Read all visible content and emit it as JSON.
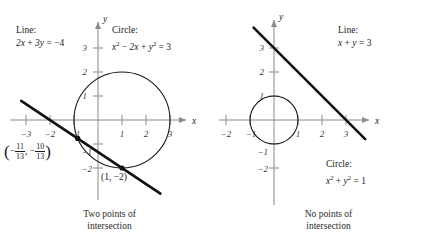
{
  "figure": {
    "background_color": "#ffffff",
    "axis_color": "#8a8a8a",
    "curve_color": "#1a1a1a",
    "line_color": "#111111",
    "text_color": "#1a1a1a"
  },
  "panels": [
    {
      "id": "left",
      "caption_line1": "Two points of",
      "caption_line2": "intersection",
      "line_label_title": "Line:",
      "line_label_equation": "2x + 3y = −4",
      "circle_label_title": "Circle:",
      "circle_label_equation": "x² − 2x + y² = 3",
      "axis_x_name": "x",
      "axis_y_name": "y",
      "x_ticks": [
        "−3",
        "−2",
        "−1",
        "1",
        "2",
        "3"
      ],
      "y_ticks": [
        "3",
        "2",
        "1",
        "−1",
        "−2"
      ],
      "point_label_fraction_x_num": "11",
      "point_label_fraction_x_den": "13",
      "point_label_fraction_y_num": "10",
      "point_label_fraction_y_den": "13",
      "point_label_simple": "(1, −2)"
    },
    {
      "id": "right",
      "caption_line1": "No points of",
      "caption_line2": "intersection",
      "line_label_title": "Line:",
      "line_label_equation": "x + y = 3",
      "circle_label_title": "Circle:",
      "circle_label_equation": "x² + y² = 1",
      "axis_x_name": "x",
      "axis_y_name": "y",
      "x_ticks": [
        "−2",
        "−1",
        "1",
        "2",
        "3"
      ],
      "y_ticks": [
        "3",
        "2",
        "1",
        "−1",
        "−2"
      ]
    }
  ],
  "chart_data": [
    {
      "type": "scatter",
      "title": "Two points of intersection",
      "xlabel": "x",
      "ylabel": "y",
      "xlim": [
        -3.6,
        3.6
      ],
      "ylim": [
        -2.9,
        3.4
      ],
      "grid": false,
      "legend": "none",
      "xticks": [
        -3,
        -2,
        -1,
        1,
        2,
        3
      ],
      "yticks": [
        3,
        2,
        1,
        -1,
        -2
      ],
      "series": [
        {
          "name": "Line: 2x + 3y = -4",
          "kind": "line",
          "equation": "2x + 3y = -4",
          "slope": -0.6666666667,
          "intercept": -1.3333333333,
          "x_start": -3.2,
          "x_end": 2.6,
          "style": "thick"
        },
        {
          "name": "Circle: x^2 - 2x + y^2 = 3",
          "kind": "circle",
          "equation": "x^2 - 2x + y^2 = 3",
          "center": [
            1,
            0
          ],
          "radius": 2,
          "style": "thin"
        }
      ],
      "intersection_points": [
        {
          "x": -0.846153846,
          "y": -0.769230769,
          "label": "(-11/13, -10/13)"
        },
        {
          "x": 1,
          "y": -2,
          "label": "(1, -2)"
        }
      ],
      "annotations": [
        {
          "text": "Line: 2x + 3y = -4",
          "x": -3.1,
          "y": 3.1
        },
        {
          "text": "Circle: x^2 - 2x + y^2 = 3",
          "x": 0.2,
          "y": 3.1
        },
        {
          "text": "(-11/13, -10/13)",
          "x": -3.2,
          "y": -1.25
        },
        {
          "text": "(1, -2)",
          "x": 0.25,
          "y": -2.55
        }
      ]
    },
    {
      "type": "scatter",
      "title": "No points of intersection",
      "xlabel": "x",
      "ylabel": "y",
      "xlim": [
        -3.0,
        4.0
      ],
      "ylim": [
        -2.9,
        3.9
      ],
      "grid": false,
      "legend": "none",
      "xticks": [
        -2,
        -1,
        1,
        2,
        3
      ],
      "yticks": [
        3,
        2,
        1,
        -1,
        -2
      ],
      "series": [
        {
          "name": "Line: x + y = 3",
          "kind": "line",
          "equation": "x + y = 3",
          "slope": -1,
          "intercept": 3,
          "x_start": -0.85,
          "x_end": 3.8,
          "style": "thick"
        },
        {
          "name": "Circle: x^2 + y^2 = 1",
          "kind": "circle",
          "equation": "x^2 + y^2 = 1",
          "center": [
            0,
            0
          ],
          "radius": 1,
          "style": "thin"
        }
      ],
      "intersection_points": [],
      "annotations": [
        {
          "text": "Line: x + y = 3",
          "x": 0.9,
          "y": 3.3
        },
        {
          "text": "Circle: x^2 + y^2 = 1",
          "x": 0.55,
          "y": -1.75
        }
      ]
    }
  ]
}
